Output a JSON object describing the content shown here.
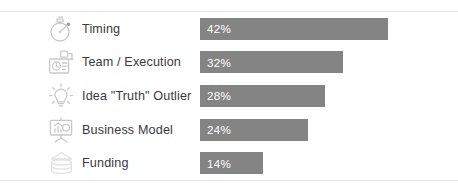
{
  "chart_data": {
    "type": "bar",
    "orientation": "horizontal",
    "title": "",
    "xlabel": "",
    "ylabel": "",
    "xlim": [
      0,
      50
    ],
    "grid": false,
    "legend": null,
    "value_suffix": "%",
    "bar_color": "#848484",
    "value_text_color": "#ffffff",
    "label_text_color": "#3a3a3c",
    "categories": [
      "Timing",
      "Team / Execution",
      "Idea \"Truth\" Outlier",
      "Business Model",
      "Funding"
    ],
    "values": [
      42,
      32,
      28,
      24,
      14
    ],
    "value_labels": [
      "42%",
      "32%",
      "28%",
      "24%",
      "14%"
    ]
  },
  "rows": [
    {
      "label": "Timing",
      "value": 42,
      "value_label": "42%",
      "icon": "stopwatch-icon"
    },
    {
      "label": "Team / Execution",
      "value": 32,
      "value_label": "32%",
      "icon": "team-badge-icon"
    },
    {
      "label": "Idea \"Truth\" Outlier",
      "value": 28,
      "value_label": "28%",
      "icon": "lightbulb-icon"
    },
    {
      "label": "Business Model",
      "value": 24,
      "value_label": "24%",
      "icon": "presentation-chart-icon"
    },
    {
      "label": "Funding",
      "value": 14,
      "value_label": "14%",
      "icon": "coin-stack-icon"
    }
  ]
}
